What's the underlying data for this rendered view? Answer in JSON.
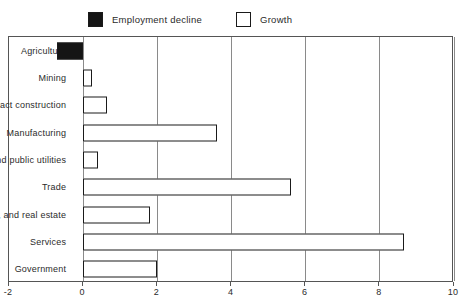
{
  "legend": {
    "entries": [
      {
        "label": "Employment decline",
        "style": "filled",
        "color": "#151515",
        "icon": "filled-square-swatch"
      },
      {
        "label": "Growth",
        "style": "hollow",
        "color": "#ffffff",
        "icon": "hollow-square-swatch"
      }
    ]
  },
  "chart_data": {
    "type": "bar",
    "orientation": "horizontal",
    "title": "",
    "subtitle": "",
    "xlabel": "",
    "ylabel": "",
    "xlim": [
      -2,
      10
    ],
    "xticks": [
      -2,
      0,
      2,
      4,
      6,
      8,
      10
    ],
    "xticklabels": [
      "-2",
      "0",
      "2",
      "4",
      "6",
      "8",
      "10"
    ],
    "grid": true,
    "grid_axis": "x",
    "legend": [
      "Employment decline",
      "Growth"
    ],
    "legend_position": "top",
    "categories": [
      "Agriculture",
      "Mining",
      "Contract construction",
      "Manufacturing",
      "Transportation and public utilities",
      "Trade",
      "Finance, insurance, and real estate",
      "Services",
      "Government"
    ],
    "values": [
      -0.7,
      0.25,
      0.65,
      3.6,
      0.4,
      5.6,
      1.8,
      8.65,
      2.0
    ],
    "series": [
      {
        "name": "Change",
        "values": [
          -0.7,
          0.25,
          0.65,
          3.6,
          0.4,
          5.6,
          1.8,
          8.65,
          2.0
        ],
        "categories": [
          "Agriculture",
          "Mining",
          "Contract construction",
          "Manufacturing",
          "Transportation and public utilities",
          "Trade",
          "Finance, insurance, and real estate",
          "Services",
          "Government"
        ],
        "bar_styles": [
          "filled",
          "hollow",
          "hollow",
          "hollow",
          "hollow",
          "hollow",
          "hollow",
          "hollow",
          "hollow"
        ]
      }
    ]
  }
}
